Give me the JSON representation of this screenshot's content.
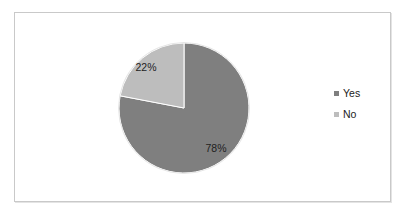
{
  "chart_data": {
    "type": "pie",
    "title": "",
    "categories": [
      "Yes",
      "No"
    ],
    "values": [
      78,
      22
    ],
    "labels": [
      "78%",
      "22%"
    ],
    "colors": [
      "#7f7f7f",
      "#bdbdbd"
    ],
    "legend": {
      "position": "right",
      "entries": [
        {
          "label": "Yes",
          "color": "#7f7f7f"
        },
        {
          "label": "No",
          "color": "#bdbdbd"
        }
      ]
    },
    "start_angle_deg": 0,
    "direction": "clockwise",
    "grid": false
  },
  "pie": {
    "yes_label": "78%",
    "no_label": "22%"
  },
  "legend": {
    "items": [
      {
        "label": "Yes",
        "color": "#7f7f7f"
      },
      {
        "label": "No",
        "color": "#bdbdbd"
      }
    ]
  }
}
